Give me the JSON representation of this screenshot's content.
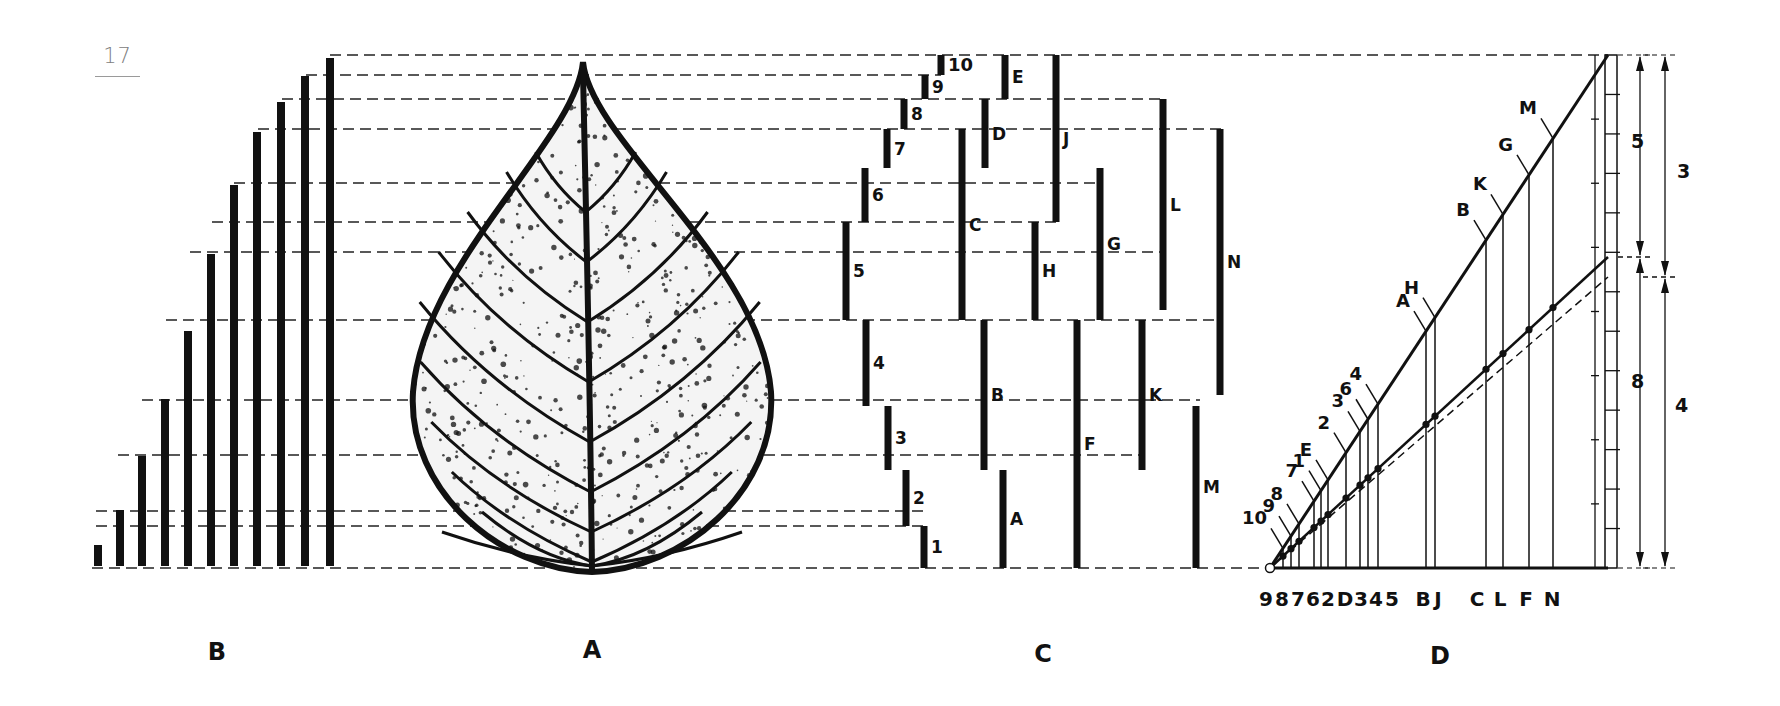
{
  "page": {
    "number": "17"
  },
  "figure": {
    "panels": [
      {
        "id": "B",
        "label": "B",
        "x": 217,
        "y": 660
      },
      {
        "id": "A",
        "label": "A",
        "x": 592,
        "y": 658
      },
      {
        "id": "C",
        "label": "C",
        "x": 1043,
        "y": 662
      },
      {
        "id": "D",
        "label": "D",
        "x": 1440,
        "y": 664
      }
    ],
    "colors": {
      "ink": "#111111",
      "dash": "#222222",
      "page_number": "#808080"
    },
    "dashed_levels": [
      {
        "y": 55,
        "x1": 330,
        "x2": 1608
      },
      {
        "y": 75,
        "x1": 306,
        "x2": 941
      },
      {
        "y": 99,
        "x1": 282,
        "x2": 1165
      },
      {
        "y": 129,
        "x1": 258,
        "x2": 1223
      },
      {
        "y": 183,
        "x1": 234,
        "x2": 1100
      },
      {
        "y": 222,
        "x1": 212,
        "x2": 1062
      },
      {
        "y": 252,
        "x1": 190,
        "x2": 1165
      },
      {
        "y": 320,
        "x1": 166,
        "x2": 1223
      },
      {
        "y": 400,
        "x1": 142,
        "x2": 1200
      },
      {
        "y": 455,
        "x1": 118,
        "x2": 1145
      },
      {
        "y": 511,
        "x1": 96,
        "x2": 925
      },
      {
        "y": 526,
        "x1": 96,
        "x2": 925
      },
      {
        "y": 568,
        "x1": 92,
        "x2": 1270
      }
    ],
    "panel_B": {
      "description": "Eleven vertical bars of increasing height",
      "bars": [
        {
          "x": 98,
          "top": 545
        },
        {
          "x": 120,
          "top": 510
        },
        {
          "x": 142,
          "top": 456
        },
        {
          "x": 165,
          "top": 399
        },
        {
          "x": 188,
          "top": 331
        },
        {
          "x": 211,
          "top": 254
        },
        {
          "x": 234,
          "top": 185
        },
        {
          "x": 257,
          "top": 132
        },
        {
          "x": 281,
          "top": 102
        },
        {
          "x": 305,
          "top": 76
        },
        {
          "x": 330,
          "top": 58
        }
      ],
      "bottom": 566
    },
    "panel_A": {
      "description": "Skeleton leaf with pointed tip and central midrib",
      "tip": {
        "x": 583,
        "y": 62
      },
      "base": {
        "x": 592,
        "y": 572
      },
      "left": 413,
      "right": 771
    },
    "panel_C": {
      "segments": [
        {
          "label": "1",
          "x": 924,
          "y1": 526,
          "y2": 568
        },
        {
          "label": "2",
          "x": 906,
          "y1": 470,
          "y2": 526
        },
        {
          "label": "3",
          "x": 888,
          "y1": 406,
          "y2": 470
        },
        {
          "label": "4",
          "x": 866,
          "y1": 320,
          "y2": 406
        },
        {
          "label": "5",
          "x": 846,
          "y1": 222,
          "y2": 320
        },
        {
          "label": "6",
          "x": 865,
          "y1": 168,
          "y2": 222
        },
        {
          "label": "7",
          "x": 887,
          "y1": 129,
          "y2": 168
        },
        {
          "label": "8",
          "x": 904,
          "y1": 99,
          "y2": 129
        },
        {
          "label": "9",
          "x": 925,
          "y1": 75,
          "y2": 99
        },
        {
          "label": "10",
          "x": 941,
          "y1": 55,
          "y2": 75
        },
        {
          "label": "A",
          "x": 1003,
          "y1": 470,
          "y2": 568
        },
        {
          "label": "B",
          "x": 984,
          "y1": 320,
          "y2": 470
        },
        {
          "label": "C",
          "x": 962,
          "y1": 129,
          "y2": 320
        },
        {
          "label": "D",
          "x": 985,
          "y1": 99,
          "y2": 168
        },
        {
          "label": "E",
          "x": 1005,
          "y1": 55,
          "y2": 99
        },
        {
          "label": "F",
          "x": 1077,
          "y1": 320,
          "y2": 568
        },
        {
          "label": "G",
          "x": 1100,
          "y1": 168,
          "y2": 320
        },
        {
          "label": "H",
          "x": 1035,
          "y1": 222,
          "y2": 320
        },
        {
          "label": "J",
          "x": 1056,
          "y1": 55,
          "y2": 222
        },
        {
          "label": "K",
          "x": 1142,
          "y1": 320,
          "y2": 470
        },
        {
          "label": "L",
          "x": 1163,
          "y1": 99,
          "y2": 310
        },
        {
          "label": "M",
          "x": 1196,
          "y1": 406,
          "y2": 568
        },
        {
          "label": "N",
          "x": 1220,
          "y1": 129,
          "y2": 395
        }
      ]
    },
    "panel_D": {
      "origin": {
        "x": 1270,
        "y": 568
      },
      "upper_line_end": {
        "x": 1608,
        "y": 55
      },
      "lower_line_end": {
        "x": 1608,
        "y": 257
      },
      "dashed_line_end": {
        "x": 1608,
        "y": 277
      },
      "baseline_end": {
        "x": 1608,
        "y": 568
      },
      "upper_labels": [
        {
          "label": "10",
          "x": 1283
        },
        {
          "label": "9",
          "x": 1291
        },
        {
          "label": "8",
          "x": 1299
        },
        {
          "label": "7",
          "x": 1314
        },
        {
          "label": "1",
          "x": 1321
        },
        {
          "label": "E",
          "x": 1328
        },
        {
          "label": "2",
          "x": 1346
        },
        {
          "label": "3",
          "x": 1360
        },
        {
          "label": "6",
          "x": 1368
        },
        {
          "label": "4",
          "x": 1378
        },
        {
          "label": "A",
          "x": 1426
        },
        {
          "label": "H",
          "x": 1435
        },
        {
          "label": "B",
          "x": 1486
        },
        {
          "label": "K",
          "x": 1503
        },
        {
          "label": "G",
          "x": 1529
        },
        {
          "label": "M",
          "x": 1553
        }
      ],
      "bottom_labels": [
        {
          "label": "9",
          "x": 1266
        },
        {
          "label": "8",
          "x": 1282
        },
        {
          "label": "7",
          "x": 1298
        },
        {
          "label": "6",
          "x": 1313
        },
        {
          "label": "2",
          "x": 1328
        },
        {
          "label": "D",
          "x": 1345
        },
        {
          "label": "3",
          "x": 1361
        },
        {
          "label": "4",
          "x": 1376
        },
        {
          "label": "5",
          "x": 1392
        },
        {
          "label": "B",
          "x": 1423
        },
        {
          "label": "J",
          "x": 1438
        },
        {
          "label": "C",
          "x": 1477
        },
        {
          "label": "L",
          "x": 1500
        },
        {
          "label": "F",
          "x": 1526
        },
        {
          "label": "N",
          "x": 1552
        }
      ],
      "ruler": {
        "x": 1605,
        "width": 12,
        "top": 55,
        "bottom": 568
      },
      "dimensions": [
        {
          "label": "5",
          "x": 1640,
          "y1": 55,
          "y2": 257,
          "text_x": 1631,
          "text_y": 148
        },
        {
          "label": "8",
          "x": 1640,
          "y1": 257,
          "y2": 568,
          "text_x": 1631,
          "text_y": 388
        },
        {
          "label": "3",
          "x": 1665,
          "y1": 55,
          "y2": 277,
          "text_x": 1677,
          "text_y": 178
        },
        {
          "label": "4",
          "x": 1665,
          "y1": 277,
          "y2": 568,
          "text_x": 1675,
          "text_y": 412
        }
      ]
    }
  }
}
